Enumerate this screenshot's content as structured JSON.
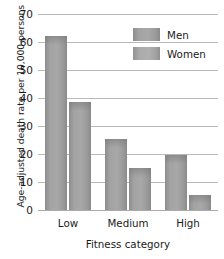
{
  "chart_data": {
    "type": "bar",
    "title": "",
    "subtitle": "",
    "xlabel": "Fitness category",
    "ylabel": "Age-adjusted death rate per 10,000 persons",
    "categories": [
      "Low",
      "Medium",
      "High"
    ],
    "series": [
      {
        "name": "Men",
        "values": [
          62,
          25.5,
          19.5
        ],
        "color": "#a3a3a3"
      },
      {
        "name": "Women",
        "values": [
          38.5,
          15,
          5.5
        ],
        "color": "#ababab"
      }
    ],
    "ylim": [
      0,
      70
    ],
    "ytick_labels": [
      "0",
      "10",
      "20",
      "30",
      "40",
      "50",
      "60",
      "70"
    ],
    "ytick_values": [
      0,
      10,
      20,
      30,
      40,
      50,
      60,
      70
    ],
    "grid": "horizontal",
    "legend_position": "top-right",
    "legend_entries": [
      "Men",
      "Women"
    ],
    "annotations": []
  },
  "axes": {
    "y_title": "Age-adjusted death rate per 10,000 persons",
    "x_title": "Fitness category"
  },
  "legend": {
    "items": [
      {
        "label": "Men"
      },
      {
        "label": "Women"
      }
    ]
  }
}
